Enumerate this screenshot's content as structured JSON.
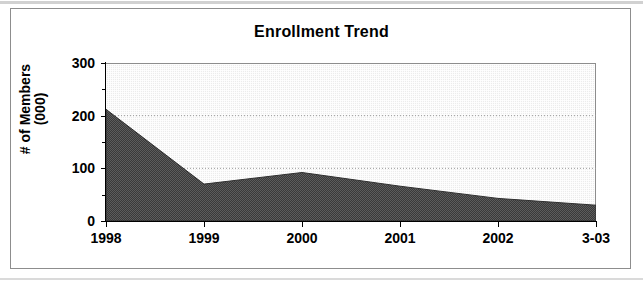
{
  "chart_data": {
    "type": "area",
    "title": "Enrollment Trend",
    "xlabel": "",
    "ylabel": "# of Members (000)",
    "ylabel_lines": [
      "# of Members",
      "(000)"
    ],
    "categories": [
      "1998",
      "1999",
      "2000",
      "2001",
      "2002",
      "3-03"
    ],
    "values": [
      212,
      70,
      92,
      66,
      43,
      30
    ],
    "series": [
      {
        "name": "# of Members (000)",
        "values": [
          212,
          70,
          92,
          66,
          43,
          30
        ]
      }
    ],
    "ylim": [
      0,
      300
    ],
    "yticks": [
      0,
      100,
      200,
      300
    ],
    "ytick_labels": [
      "0",
      "100",
      "200",
      "300"
    ],
    "yminor_ticks": [
      50,
      150,
      250
    ],
    "gridlines": [
      100,
      200
    ],
    "grid": true,
    "legend": "none",
    "colors": {
      "area_fill": "#595959",
      "plot_background": "#ececec",
      "axis": "#000000",
      "gridline": "#9a9a9a",
      "frame_border": "#8d8d8d",
      "text": "#000000"
    }
  }
}
